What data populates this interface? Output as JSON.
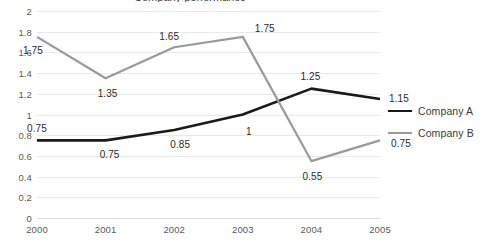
{
  "chart_data": {
    "type": "line",
    "title": "Company performance",
    "xlabel": "",
    "ylabel": "",
    "categories": [
      "2000",
      "2001",
      "2002",
      "2003",
      "2004",
      "2005"
    ],
    "ylim": [
      0,
      2
    ],
    "yticks": [
      "0",
      "0.2",
      "0.4",
      "0.6",
      "0.8",
      "1",
      "1.2",
      "1.4",
      "1.6",
      "1.8",
      "2"
    ],
    "ytick_values": [
      0,
      0.2,
      0.4,
      0.6,
      0.8,
      1,
      1.2,
      1.4,
      1.6,
      1.8,
      2
    ],
    "grid": true,
    "legend_position": "right",
    "series": [
      {
        "name": "Company A",
        "color": "#1a1a1a",
        "line_width": 2.6,
        "values": [
          0.75,
          0.75,
          0.85,
          1,
          1.25,
          1.15
        ],
        "labels": [
          "0.75",
          "0.75",
          "0.85",
          "1",
          "1.25",
          "1.15"
        ],
        "label_offsets": [
          {
            "dx": 0,
            "dy": -12
          },
          {
            "dx": 4,
            "dy": 14
          },
          {
            "dx": 6,
            "dy": 14
          },
          {
            "dx": 6,
            "dy": 16
          },
          {
            "dx": -1,
            "dy": -13
          },
          {
            "dx": 19,
            "dy": -1
          }
        ]
      },
      {
        "name": "Company B",
        "color": "#9a9a9a",
        "line_width": 2.2,
        "values": [
          1.75,
          1.35,
          1.65,
          1.75,
          0.55,
          0.75
        ],
        "labels": [
          "1.75",
          "1.35",
          "1.65",
          "1.75",
          "0.55",
          "0.75"
        ],
        "label_offsets": [
          {
            "dx": -4,
            "dy": 13
          },
          {
            "dx": 2,
            "dy": 15
          },
          {
            "dx": -5,
            "dy": -11
          },
          {
            "dx": 22,
            "dy": -9
          },
          {
            "dx": 1,
            "dy": 15
          },
          {
            "dx": 21,
            "dy": 3
          }
        ]
      }
    ]
  }
}
